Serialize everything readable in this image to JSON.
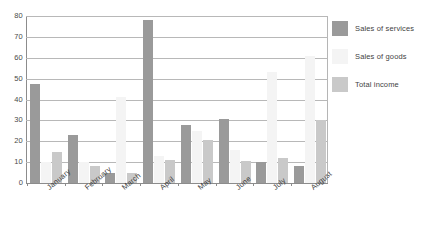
{
  "chart_data": {
    "type": "bar",
    "title": "",
    "xlabel": "",
    "ylabel": "",
    "ylim": [
      0,
      80
    ],
    "ytick_step": 10,
    "yticks": [
      80,
      70,
      60,
      50,
      40,
      30,
      20,
      10,
      0
    ],
    "grid": true,
    "legend_position": "right",
    "categories": [
      "January",
      "February",
      "March",
      "April",
      "May",
      "June",
      "July",
      "August"
    ],
    "series": [
      {
        "name": "Sales of services",
        "color": "#9a9a9a",
        "values": [
          47.5,
          23,
          5,
          78,
          28,
          30.5,
          10,
          8
        ]
      },
      {
        "name": "Sales of goods",
        "color": "#f4f4f4",
        "values": [
          10,
          10,
          41,
          13,
          25,
          16,
          53,
          61
        ]
      },
      {
        "name": "Total income",
        "color": "#c9c9c9",
        "values": [
          15,
          8,
          5,
          11,
          20.5,
          10.5,
          12,
          30
        ]
      }
    ]
  }
}
